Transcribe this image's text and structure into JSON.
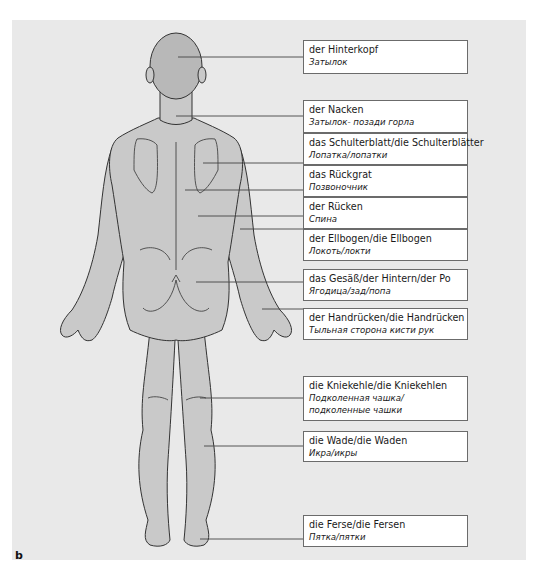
{
  "figure": {
    "panel_letter": "b",
    "view": "posterior",
    "colors": {
      "background": "#e9e9e9",
      "skin": "#c9c9c9",
      "outline": "#333333",
      "leader": "#444444",
      "box_border": "#6b6b6b"
    }
  },
  "labels": [
    {
      "de": "der Hinterkopf",
      "ru": "Затылок"
    },
    {
      "de": "der Nacken",
      "ru": "Затылок- позади горла"
    },
    {
      "de": "das Schulterblatt/die Schulterblätter",
      "ru": "Лопатка/лопатки"
    },
    {
      "de": "das Rückgrat",
      "ru": "Позвоночник"
    },
    {
      "de": "der Rücken",
      "ru": "Спина"
    },
    {
      "de": "der Ellbogen/die Ellbogen",
      "ru": "Локоть/локти"
    },
    {
      "de": "das Gesäß/der Hintern/der Po",
      "ru": "Ягодица/зад/попа"
    },
    {
      "de": "der Handrücken/die Handrücken",
      "ru": "Тыльная сторона кисти рук"
    },
    {
      "de": "die Kniekehle/die Kniekehlen",
      "ru": "Подколенная чашка/",
      "ru2": "подколенные чашки"
    },
    {
      "de": "die Wade/die Waden",
      "ru": "Икра/икры"
    },
    {
      "de": "die Ferse/die Fersen",
      "ru": "Пятка/пятки"
    }
  ]
}
